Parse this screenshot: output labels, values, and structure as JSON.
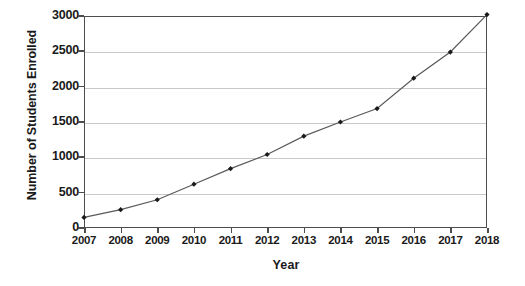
{
  "chart_data": {
    "type": "line",
    "title": "",
    "xlabel": "Year",
    "ylabel": "Number of Students Enrolled",
    "categories": [
      "2007",
      "2008",
      "2009",
      "2010",
      "2011",
      "2012",
      "2013",
      "2014",
      "2015",
      "2016",
      "2017",
      "2018"
    ],
    "x": [
      2007,
      2008,
      2009,
      2010,
      2011,
      2012,
      2013,
      2014,
      2015,
      2016,
      2017,
      2018
    ],
    "values": [
      150,
      260,
      400,
      620,
      840,
      1040,
      1300,
      1500,
      1690,
      2120,
      2490,
      3020
    ],
    "series": [
      {
        "name": "Number of Students Enrolled",
        "values": [
          150,
          260,
          400,
          620,
          840,
          1040,
          1300,
          1500,
          1690,
          2120,
          2490,
          3020
        ]
      }
    ],
    "ylim": [
      0,
      3000
    ],
    "xlim": [
      2007,
      2018
    ],
    "yticks": [
      0,
      500,
      1000,
      1500,
      2000,
      2500,
      3000
    ],
    "ytick_labels": [
      "0",
      "500",
      "1000",
      "1500",
      "2000",
      "2500",
      "3000"
    ],
    "xtick_labels": [
      "2007",
      "2008",
      "2009",
      "2010",
      "2011",
      "2012",
      "2013",
      "2014",
      "2015",
      "2016",
      "2017",
      "2018"
    ],
    "grid": "horizontal",
    "legend": "none",
    "marker": "diamond",
    "line_color": "#595959",
    "marker_color": "#1a1a1a",
    "grid_color": "#c9c9c9",
    "axis_color": "#4d4d4d",
    "background_color": "#ffffff"
  }
}
